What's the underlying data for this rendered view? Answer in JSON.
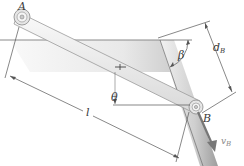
{
  "diagram": {
    "type": "mechanics-linkage",
    "labels": {
      "pin_a": "A",
      "pin_b": "B",
      "angle_beta": "β",
      "angle_theta": "θ",
      "length": "l",
      "distance_main": "d",
      "distance_sub": "B",
      "velocity_main": "v",
      "velocity_sub": "B"
    },
    "colors": {
      "surface": "#e8e8e8",
      "surface_shadow": "#bdbdbd",
      "bar_fill": "#f0f0f0",
      "bar_edge": "#9a9a9a",
      "dimension_line": "#555555",
      "text": "#3a3a3a"
    }
  }
}
